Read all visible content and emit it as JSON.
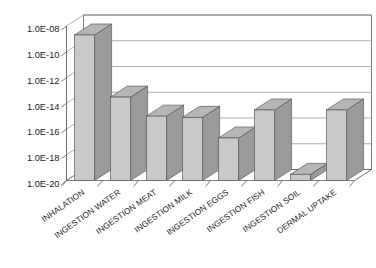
{
  "chart_data": {
    "type": "bar",
    "title": "",
    "subtitle": "",
    "xlabel": "",
    "ylabel": "",
    "yscale": "log",
    "ylim": [
      1e-20,
      1e-08
    ],
    "grid": true,
    "legend": false,
    "legend_position": "none",
    "style": "3d-column",
    "categories": [
      "INHALATION",
      "INGESTION WATER",
      "INGESTION MEAT",
      "INGESTION MILK",
      "INGESTION EGGS",
      "INGESTION FISH",
      "INGESTION SOIL",
      "DERMAL UPTAKE"
    ],
    "values": [
      2e-09,
      3e-14,
      1e-15,
      8e-16,
      2e-17,
      3e-15,
      3e-20,
      3e-15
    ],
    "value_labels": [
      "2E-09",
      "3E-14",
      "1E-15",
      "8E-16",
      "2E-17",
      "3E-15",
      "3E-20",
      "3E-15"
    ],
    "ytick_values": [
      1e-08,
      1e-10,
      1e-12,
      1e-14,
      1e-16,
      1e-18,
      1e-20
    ],
    "ytick_labels": [
      "1.0E-08",
      "1.0E-10",
      "1.0E-12",
      "1.0E-14",
      "1.0E-16",
      "1.0E-18",
      "1.0E-20"
    ]
  },
  "colors": {
    "bar_face": "#c9c9c9",
    "bar_side": "#9a9a9a",
    "bar_top": "#b6b6b6",
    "bar_edge": "#4a4a4a",
    "plot_background": "#ffffff",
    "grid": "#8c8c8c",
    "axis": "#5a5a5a",
    "text": "#1d1d1d",
    "page_background": "#ffffff"
  }
}
